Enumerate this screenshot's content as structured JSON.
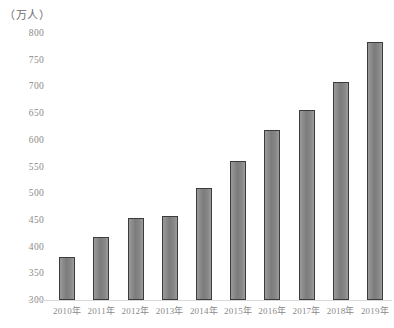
{
  "chart_data": {
    "type": "bar",
    "title": "",
    "subtitle": "",
    "unit_caption": "（万人）",
    "xlabel": "",
    "ylabel": "",
    "ylim": [
      300,
      800
    ],
    "ytick_step": 50,
    "yticks": [
      "800",
      "750",
      "700",
      "650",
      "600",
      "550",
      "500",
      "450",
      "400",
      "350",
      "300"
    ],
    "grid": false,
    "legend": null,
    "categories": [
      "2010年",
      "2011年",
      "2012年",
      "2013年",
      "2014年",
      "2015年",
      "2016年",
      "2017年",
      "2018年",
      "2019年"
    ],
    "values": [
      380,
      418,
      453,
      457,
      510,
      560,
      618,
      655,
      708,
      783
    ],
    "series": [
      {
        "name": "",
        "values": [
          380,
          418,
          453,
          457,
          510,
          560,
          618,
          655,
          708,
          783
        ]
      }
    ]
  },
  "style": {
    "bar_fill": "#8a8a8a",
    "bar_border": "#3b3b3b",
    "axis_text": "#8a8a8a",
    "caption_text": "#6e6e6e",
    "baseline": "#d9d9d9",
    "background": "#ffffff"
  }
}
